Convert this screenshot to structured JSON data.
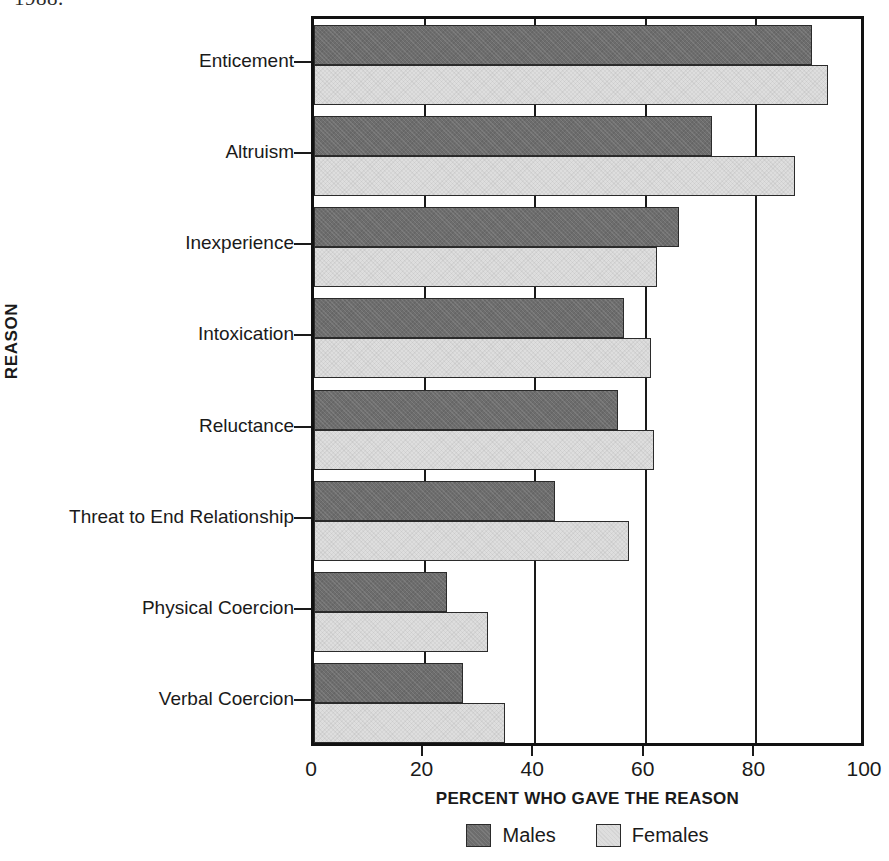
{
  "caption_fragment": "1988.",
  "chart_data": {
    "type": "bar",
    "orientation": "horizontal",
    "title": "",
    "xlabel": "PERCENT WHO GAVE THE REASON",
    "ylabel": "REASON",
    "xlim": [
      0,
      100
    ],
    "xticks": [
      0,
      20,
      40,
      60,
      80,
      100
    ],
    "xtick_labels": [
      "0",
      "20",
      "40",
      "60",
      "80",
      "100"
    ],
    "grid": "vertical",
    "legend_position": "bottom-center",
    "categories": [
      "Enticement",
      "Altruism",
      "Inexperience",
      "Intoxication",
      "Reluctance",
      "Threat to End Relationship",
      "Physical Coercion",
      "Verbal Coercion"
    ],
    "series": [
      {
        "name": "Males",
        "color": "#6d6d6d",
        "values": [
          90,
          72,
          66,
          56,
          55,
          43.5,
          24,
          27
        ]
      },
      {
        "name": "Females",
        "color": "#dedede",
        "values": [
          93,
          87,
          62,
          61,
          61.5,
          57,
          31.5,
          34.5
        ]
      }
    ]
  },
  "legend": {
    "items": [
      {
        "label": "Males",
        "swatch": "males"
      },
      {
        "label": "Females",
        "swatch": "females"
      }
    ]
  }
}
